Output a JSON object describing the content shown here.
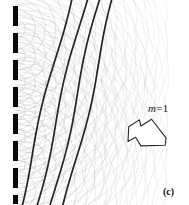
{
  "figure": {
    "panel_label": "(c)",
    "order_label": {
      "symbol": "m",
      "equals": "=",
      "value": "1",
      "full": "m = 1"
    },
    "colors": {
      "background": "#ffffff",
      "barrier": "#0a0a0a",
      "wavelet_arc": "#9a9a9a",
      "reinforced_wavefront": "#141414",
      "arrow_outline": "#2a2a2a",
      "text": "#111111"
    },
    "barrier": {
      "name": "diffraction-grating-barrier",
      "x": 13,
      "dash_width": 5,
      "segments": [
        {
          "y": 6,
          "height": 20
        },
        {
          "y": 33,
          "height": 20
        },
        {
          "y": 60,
          "height": 20
        },
        {
          "y": 87,
          "height": 20
        },
        {
          "y": 114,
          "height": 20
        },
        {
          "y": 141,
          "height": 20
        },
        {
          "y": 168,
          "height": 20
        },
        {
          "y": 195,
          "height": 9
        }
      ],
      "slits": [
        {
          "index": 1,
          "x": 15,
          "y": 29
        },
        {
          "index": 2,
          "x": 15,
          "y": 56
        },
        {
          "index": 3,
          "x": 15,
          "y": 83
        },
        {
          "index": 4,
          "x": 15,
          "y": 110
        },
        {
          "index": 5,
          "x": 15,
          "y": 137
        },
        {
          "index": 6,
          "x": 15,
          "y": 164
        },
        {
          "index": 7,
          "x": 15,
          "y": 191
        }
      ]
    },
    "wavelets": {
      "name": "huygens-circular-wavelets",
      "wavelength": 13,
      "rings_per_slit": 15,
      "stroke_width": 0.5
    },
    "wavefronts": {
      "name": "first-order-reinforced-wavefronts",
      "count": 4,
      "stroke_width": 1.7,
      "direction_deg": 28,
      "lines": [
        {
          "index": 1,
          "top_x": 71,
          "bottom_x": 19
        },
        {
          "index": 2,
          "top_x": 87,
          "bottom_x": 35
        },
        {
          "index": 3,
          "top_x": 101,
          "bottom_x": 50
        },
        {
          "index": 4,
          "top_x": 115,
          "bottom_x": 64
        }
      ]
    },
    "arrow": {
      "name": "diffraction-direction-arrow",
      "x": 128,
      "y": 118,
      "width": 38,
      "height": 31,
      "points_toward": "lower-right"
    }
  }
}
